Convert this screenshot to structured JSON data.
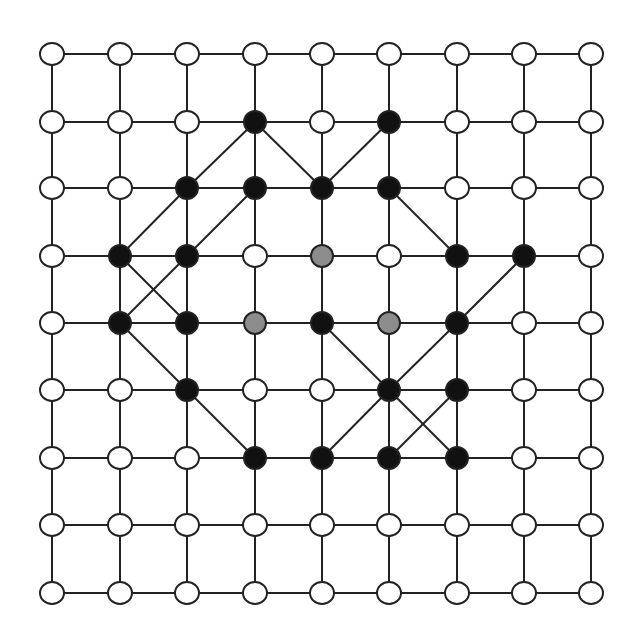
{
  "diagram": {
    "type": "grid-graph",
    "rows": 9,
    "cols": 9,
    "colors": {
      "white": "#ffffff",
      "black": "#111111",
      "gray": "#8c8c8c",
      "edge": "#222222"
    },
    "col_x": [
      52,
      120,
      187,
      255,
      322,
      389,
      457,
      524,
      591
    ],
    "row_y": [
      54,
      122,
      188,
      256,
      323,
      390,
      458,
      525,
      593
    ],
    "node_radius": 11,
    "black_nodes": [
      [
        1,
        3
      ],
      [
        1,
        5
      ],
      [
        2,
        2
      ],
      [
        2,
        3
      ],
      [
        2,
        4
      ],
      [
        2,
        5
      ],
      [
        3,
        1
      ],
      [
        3,
        2
      ],
      [
        3,
        6
      ],
      [
        3,
        7
      ],
      [
        4,
        1
      ],
      [
        4,
        2
      ],
      [
        4,
        4
      ],
      [
        4,
        6
      ],
      [
        5,
        2
      ],
      [
        5,
        5
      ],
      [
        5,
        6
      ],
      [
        6,
        3
      ],
      [
        6,
        4
      ],
      [
        6,
        5
      ],
      [
        6,
        6
      ]
    ],
    "gray_nodes": [
      [
        3,
        4
      ],
      [
        4,
        3
      ],
      [
        4,
        5
      ]
    ],
    "diagonal_edges": [
      [
        [
          1,
          3
        ],
        [
          2,
          2
        ]
      ],
      [
        [
          2,
          2
        ],
        [
          3,
          1
        ]
      ],
      [
        [
          1,
          3
        ],
        [
          2,
          4
        ]
      ],
      [
        [
          1,
          5
        ],
        [
          2,
          4
        ]
      ],
      [
        [
          2,
          3
        ],
        [
          3,
          2
        ]
      ],
      [
        [
          3,
          2
        ],
        [
          4,
          1
        ]
      ],
      [
        [
          3,
          1
        ],
        [
          4,
          2
        ]
      ],
      [
        [
          2,
          5
        ],
        [
          3,
          6
        ]
      ],
      [
        [
          3,
          7
        ],
        [
          4,
          6
        ]
      ],
      [
        [
          4,
          6
        ],
        [
          5,
          5
        ]
      ],
      [
        [
          5,
          5
        ],
        [
          6,
          4
        ]
      ],
      [
        [
          4,
          1
        ],
        [
          5,
          2
        ]
      ],
      [
        [
          5,
          2
        ],
        [
          6,
          3
        ]
      ],
      [
        [
          4,
          4
        ],
        [
          5,
          5
        ]
      ],
      [
        [
          5,
          5
        ],
        [
          6,
          6
        ]
      ],
      [
        [
          5,
          6
        ],
        [
          6,
          5
        ]
      ]
    ]
  }
}
